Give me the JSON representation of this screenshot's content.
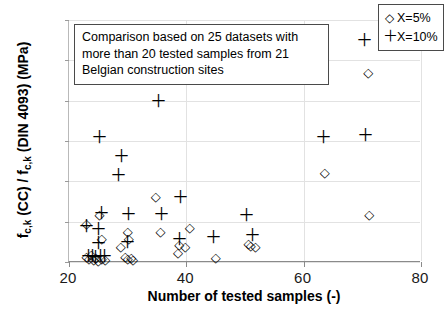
{
  "chart_data": {
    "type": "scatter",
    "title": "",
    "xlabel": "Number of tested samples (-)",
    "ylabel": "f_c,k (CC) / f_c,k (DIN 4093) (MPa)",
    "ylabel_parts": {
      "p1": "f",
      "sub1": "c,k",
      "p2": " (CC) / f",
      "sub2": "c,k",
      "p3": " (DIN 4093) (MPa)"
    },
    "xlim": [
      20,
      80
    ],
    "ylim": [
      1.0,
      4.0
    ],
    "xticks": [
      20,
      40,
      60,
      80
    ],
    "xtick_labels": [
      "20",
      "40",
      "60",
      "80"
    ],
    "yticks": [
      1.0,
      1.5,
      2.0,
      2.5,
      3.0,
      3.5,
      4.0
    ],
    "ytick_labels": [
      "1,0",
      "1,5",
      "2,0",
      "2,5",
      "3,0",
      "3,5",
      "4,0"
    ],
    "grid": true,
    "grid_color": "#e2e2e2",
    "legend_position": "top-right",
    "marker_color": "#000000",
    "series": [
      {
        "name": "X=5%",
        "marker": "diamond",
        "symbol": "◇",
        "points": [
          [
            23.0,
            1.48
          ],
          [
            25.2,
            1.6
          ],
          [
            25.6,
            1.3
          ],
          [
            23.0,
            1.08
          ],
          [
            23.4,
            1.05
          ],
          [
            23.8,
            1.1
          ],
          [
            24.2,
            1.04
          ],
          [
            24.6,
            1.06
          ],
          [
            25.0,
            1.03
          ],
          [
            25.6,
            1.05
          ],
          [
            26.2,
            1.04
          ],
          [
            28.8,
            1.2
          ],
          [
            30.0,
            1.38
          ],
          [
            30.2,
            1.3
          ],
          [
            29.6,
            1.07
          ],
          [
            30.0,
            1.05
          ],
          [
            30.6,
            1.06
          ],
          [
            30.9,
            1.04
          ],
          [
            34.8,
            1.82
          ],
          [
            35.6,
            1.38
          ],
          [
            38.8,
            1.22
          ],
          [
            38.6,
            1.12
          ],
          [
            40.6,
            1.44
          ],
          [
            39.8,
            1.2
          ],
          [
            45.0,
            1.06
          ],
          [
            50.6,
            1.24
          ],
          [
            51.0,
            1.21
          ],
          [
            51.8,
            1.2
          ],
          [
            63.6,
            2.11
          ],
          [
            71.0,
            3.35
          ],
          [
            71.2,
            1.59
          ]
        ]
      },
      {
        "name": "X=10%",
        "marker": "plus",
        "symbol": "＋",
        "points": [
          [
            23.0,
            1.45
          ],
          [
            25.6,
            1.61
          ],
          [
            25.0,
            1.41
          ],
          [
            25.0,
            1.24
          ],
          [
            23.4,
            1.08
          ],
          [
            24.0,
            1.07
          ],
          [
            24.6,
            1.06
          ],
          [
            25.4,
            1.08
          ],
          [
            26.0,
            1.07
          ],
          [
            25.2,
            2.55
          ],
          [
            28.4,
            2.08
          ],
          [
            29.0,
            2.32
          ],
          [
            30.2,
            1.59
          ],
          [
            30.0,
            1.25
          ],
          [
            35.2,
            3.0
          ],
          [
            35.8,
            1.59
          ],
          [
            39.0,
            1.8
          ],
          [
            38.8,
            1.28
          ],
          [
            44.6,
            1.31
          ],
          [
            50.2,
            1.58
          ],
          [
            51.2,
            1.33
          ],
          [
            63.4,
            2.55
          ],
          [
            70.6,
            2.57
          ],
          [
            70.4,
            3.75
          ]
        ]
      }
    ],
    "annotation": {
      "line1": "Comparison based on 25 datasets with",
      "line2": "more than 20 tested samples from 21",
      "line3": "Belgian construction sites"
    }
  },
  "legend": {
    "entries": [
      {
        "symbol": "◇",
        "label": "X=5%"
      },
      {
        "symbol": "＋",
        "label": "X=10%"
      }
    ]
  }
}
